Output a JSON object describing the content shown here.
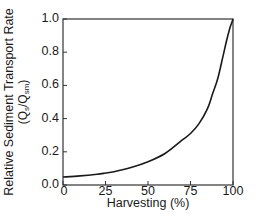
{
  "chart_data": {
    "type": "line",
    "title": "",
    "xlabel": "Harvesting (%)",
    "ylabel": "Relative Sediment Transport Rate",
    "ylabel_line2": "(Qs/Qsm)",
    "ylabel_line2_parts": {
      "open": "(Q",
      "sub1": "s",
      "mid": "/Q",
      "sub2": "sm",
      "close": ")"
    },
    "xlim": [
      0,
      100
    ],
    "ylim": [
      0.0,
      1.0
    ],
    "x_ticks": [
      0,
      25,
      50,
      75,
      100
    ],
    "x_tick_labels": [
      "0",
      "25",
      "50",
      "75",
      "100"
    ],
    "y_ticks": [
      0.0,
      0.2,
      0.4,
      0.6,
      0.8,
      1.0
    ],
    "y_tick_labels": [
      "0.0",
      "0.2",
      "0.4",
      "0.6",
      "0.8",
      "1.0"
    ],
    "grid": false,
    "legend": null,
    "series": [
      {
        "name": "Relative sediment transport rate",
        "color": "#1a1a1a",
        "x": [
          0,
          10,
          20,
          25,
          30,
          40,
          50,
          60,
          70,
          75,
          80,
          85,
          88,
          91,
          94,
          96,
          98,
          99,
          100
        ],
        "y": [
          0.048,
          0.055,
          0.065,
          0.072,
          0.08,
          0.105,
          0.14,
          0.19,
          0.27,
          0.31,
          0.37,
          0.46,
          0.55,
          0.64,
          0.77,
          0.86,
          0.94,
          0.97,
          1.0
        ]
      }
    ]
  }
}
